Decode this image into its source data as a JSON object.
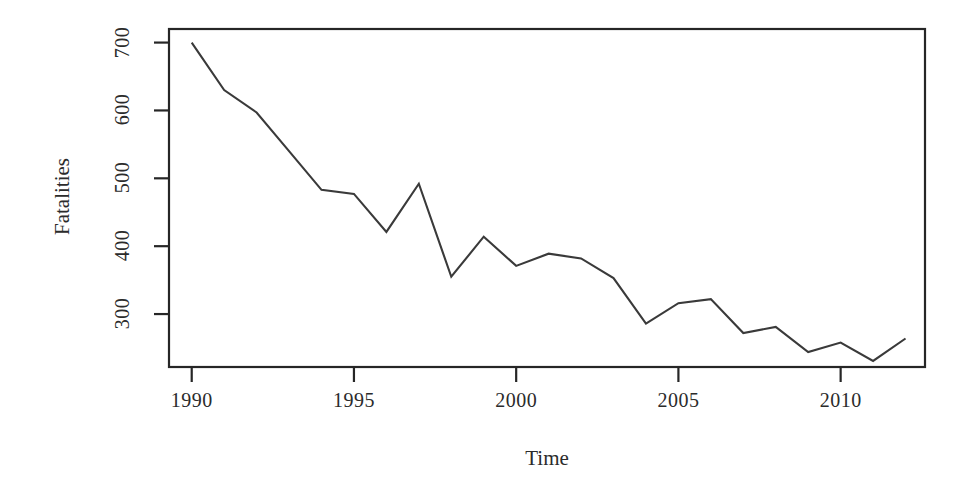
{
  "chart_data": {
    "type": "line",
    "title": "",
    "xlabel": "Time",
    "ylabel": "Fatalities",
    "x": [
      1990,
      1991,
      1992,
      1993,
      1994,
      1995,
      1996,
      1997,
      1998,
      1999,
      2000,
      2001,
      2002,
      2003,
      2004,
      2005,
      2006,
      2007,
      2008,
      2009,
      2010,
      2011,
      2012
    ],
    "values": [
      700,
      630,
      597,
      540,
      483,
      477,
      421,
      492,
      355,
      414,
      371,
      389,
      382,
      353,
      286,
      316,
      322,
      272,
      281,
      244,
      258,
      231,
      264
    ],
    "series_name": "Fatalities",
    "xticks": [
      1990,
      1995,
      2000,
      2005,
      2010
    ],
    "xtick_labels": [
      "1990",
      "1995",
      "2000",
      "2005",
      "2010"
    ],
    "yticks": [
      300,
      400,
      500,
      600,
      700
    ],
    "ytick_labels": [
      "300",
      "400",
      "500",
      "600",
      "700"
    ],
    "xlim": [
      1989.3,
      2012.6
    ],
    "ylim": [
      222,
      720
    ],
    "grid": false,
    "legend": "none",
    "line_color": "#3a3a3a",
    "axis_color": "#262626",
    "background_color": "#ffffff"
  }
}
